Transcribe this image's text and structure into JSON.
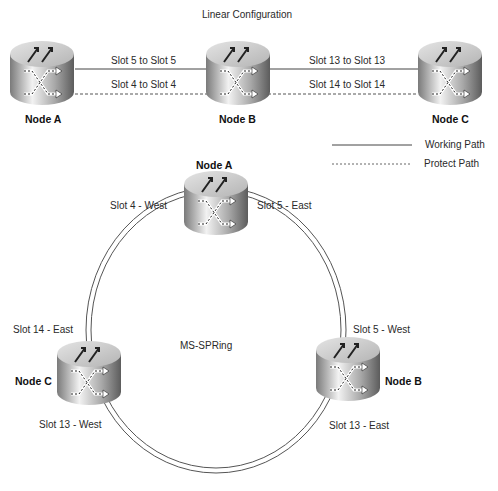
{
  "linear": {
    "title": "Linear Configuration",
    "nodes": [
      {
        "label": "Node A"
      },
      {
        "label": "Node B"
      },
      {
        "label": "Node C"
      }
    ],
    "links": [
      {
        "label": "Slot 5 to Slot 5",
        "type": "working"
      },
      {
        "label": "Slot 4 to Slot 4",
        "type": "protect"
      },
      {
        "label": "Slot 13 to Slot 13",
        "type": "working"
      },
      {
        "label": "Slot 14 to Slot 14",
        "type": "protect"
      }
    ]
  },
  "legend": {
    "items": [
      {
        "label": "Working Path",
        "style": "solid"
      },
      {
        "label": "Protect Path",
        "style": "dashed"
      }
    ]
  },
  "ring": {
    "title": "MS-SPRing",
    "nodes": [
      {
        "label": "Node A",
        "west": "Slot 4 - West",
        "east": "Slot 5 - East"
      },
      {
        "label": "Node B",
        "west": "Slot 5 - West",
        "east": "Slot 13 - East"
      },
      {
        "label": "Node C",
        "east": "Slot 14 - East",
        "west": "Slot 13 - West"
      }
    ]
  },
  "colors": {
    "line": "#444444",
    "router_top": "#cfcfcf",
    "router_side_dark": "#6e6e6e",
    "router_side_light": "#e6e6e6"
  }
}
